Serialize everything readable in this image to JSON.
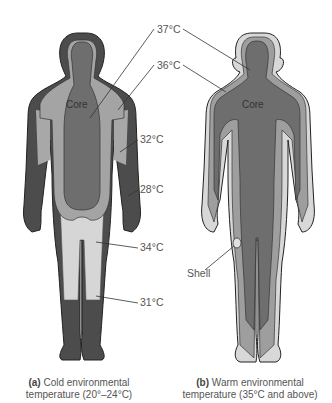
{
  "figure": {
    "panel_a": {
      "core_label": "Core",
      "labels": [
        "37°C",
        "36°C",
        "32°C",
        "28°C",
        "34°C",
        "31°C"
      ],
      "caption_bold": "(a)",
      "caption_line1": "Cold environmental",
      "caption_line2": "temperature (20°–24°C)"
    },
    "panel_b": {
      "core_label": "Core",
      "shell_label": "Shell",
      "caption_bold": "(b)",
      "caption_line1": "Warm environmental",
      "caption_line2": "temperature (35°C and above)"
    },
    "colors": {
      "dark_shell": "#4a4a4a",
      "core": "#6e6e6e",
      "mid_gray": "#a0a0a0",
      "light_gray": "#d4d4d4",
      "outline": "#222222"
    }
  }
}
